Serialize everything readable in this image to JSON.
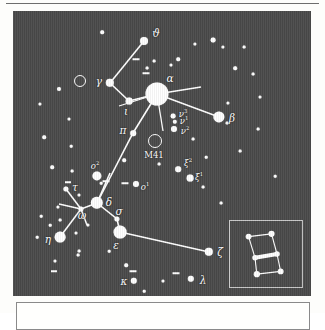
{
  "figure": {
    "kind": "star-chart",
    "constellation": "Canis Major",
    "sky_color": "#4a4a4a",
    "star_color": "#ffffff",
    "page_color": "#fdfdfb"
  },
  "chart_data": {
    "type": "scatter",
    "title": "",
    "xlabel": "",
    "ylabel": "",
    "grid": false,
    "legend": null,
    "xlim": [
      0,
      298
    ],
    "ylim": [
      0,
      285
    ],
    "note": "Canis Major star chart; x/y are panel pixel coordinates, r is plotted star radius (brighter star = larger radius).",
    "labeled_stars": [
      {
        "label": "ϑ",
        "name": "theta",
        "x": 131,
        "y": 30,
        "r": 4.0,
        "lx": 143,
        "ly": 22
      },
      {
        "label": "γ",
        "name": "gamma",
        "x": 97,
        "y": 72,
        "r": 4.2,
        "lx": 86,
        "ly": 70
      },
      {
        "label": "ι",
        "name": "iota",
        "x": 116,
        "y": 90,
        "r": 3.4,
        "lx": 113,
        "ly": 100
      },
      {
        "label": "α",
        "name": "alpha",
        "x": 144,
        "y": 83,
        "r": 11.5,
        "lx": 157,
        "ly": 67
      },
      {
        "label": "β",
        "name": "beta",
        "x": 206,
        "y": 106,
        "r": 5.6,
        "lx": 219,
        "ly": 107
      },
      {
        "label": "π",
        "name": "pi",
        "x": 120,
        "y": 122,
        "r": 2.8,
        "lx": 110,
        "ly": 119
      },
      {
        "label": "δ",
        "name": "delta",
        "x": 84,
        "y": 192,
        "r": 6.2,
        "lx": 96,
        "ly": 191
      },
      {
        "label": "ε",
        "name": "epsilon",
        "x": 107,
        "y": 221,
        "r": 6.4,
        "lx": 103,
        "ly": 234
      },
      {
        "label": "σ",
        "name": "sigma",
        "x": 104,
        "y": 208,
        "r": 2.6,
        "lx": 106,
        "ly": 200
      },
      {
        "label": "η",
        "name": "eta",
        "x": 47,
        "y": 226,
        "r": 5.4,
        "lx": 35,
        "ly": 228
      },
      {
        "label": "ζ",
        "name": "zeta",
        "x": 196,
        "y": 241,
        "r": 4.2,
        "lx": 207,
        "ly": 241
      },
      {
        "label": "κ",
        "name": "kappa",
        "x": 121,
        "y": 270,
        "r": 3.2,
        "lx": 111,
        "ly": 270
      },
      {
        "label": "λ",
        "name": "lambda",
        "x": 178,
        "y": 268,
        "r": 3.2,
        "lx": 190,
        "ly": 269
      },
      {
        "label": "τ",
        "name": "tau",
        "x": 53,
        "y": 178,
        "r": 2.6,
        "lx": 62,
        "ly": 176
      },
      {
        "label": "ω",
        "name": "omega",
        "x": 68,
        "y": 198,
        "r": 2.6,
        "lx": 69,
        "ly": 204
      }
    ],
    "superscript_stars": [
      {
        "label": "ν",
        "sup": "3",
        "name": "nu3",
        "x": 160,
        "y": 105,
        "r": 2.4,
        "lx": 170,
        "ly": 103
      },
      {
        "label": "ν",
        "sup": "1",
        "name": "nu1",
        "x": 162,
        "y": 111,
        "r": 2.2,
        "lx": 171,
        "ly": 110
      },
      {
        "label": "ν",
        "sup": "2",
        "name": "nu2",
        "x": 161,
        "y": 118,
        "r": 3.0,
        "lx": 172,
        "ly": 120
      },
      {
        "label": "ξ",
        "sup": "2",
        "name": "xi2",
        "x": 165,
        "y": 158,
        "r": 2.8,
        "lx": 175,
        "ly": 152
      },
      {
        "label": "ξ",
        "sup": "1",
        "name": "xi1",
        "x": 177,
        "y": 167,
        "r": 3.4,
        "lx": 186,
        "ly": 166
      },
      {
        "label": "ο",
        "sup": "2",
        "name": "omicron2",
        "x": 84,
        "y": 165,
        "r": 4.6,
        "lx": 82,
        "ly": 155
      },
      {
        "label": "ο",
        "sup": "1",
        "name": "omicron1",
        "x": 123,
        "y": 173,
        "r": 3.0,
        "lx": 132,
        "ly": 176
      }
    ],
    "deep_sky_objects": [
      {
        "label": "M41",
        "name": "m41-cluster",
        "x": 142,
        "y": 130,
        "r": 6.0,
        "lx": 141,
        "ly": 144
      },
      {
        "label": "",
        "name": "cluster-ring-upper-left",
        "x": 67,
        "y": 70,
        "r": 5.0,
        "lx": 0,
        "ly": 0
      }
    ],
    "constellation_lines": [
      {
        "from": "theta",
        "points": "131,30 97,72"
      },
      {
        "from": "gamma",
        "points": "97,72 116,90"
      },
      {
        "from": "iota",
        "points": "116,90 144,83"
      },
      {
        "from": "alpha-beta",
        "points": "144,83 206,106"
      },
      {
        "from": "alpha-pi-delta",
        "points": "144,83 120,122 84,192"
      },
      {
        "from": "omicron2-delta",
        "points": "97,162 84,192"
      },
      {
        "from": "delta-sigma-epsilon",
        "points": "84,192 104,208 107,221"
      },
      {
        "from": "epsilon-zeta",
        "points": "107,221 196,241"
      },
      {
        "from": "delta-omega",
        "points": "84,192 68,198"
      },
      {
        "from": "omega-tau",
        "points": "68,198 53,178"
      },
      {
        "from": "omega-eta",
        "points": "68,198 47,226"
      },
      {
        "from": "omega-left",
        "points": "68,198 46,193"
      },
      {
        "from": "omega-down",
        "points": "68,198 74,214"
      }
    ],
    "field_stars": [
      {
        "x": 89,
        "y": 21,
        "r": 1.8
      },
      {
        "x": 182,
        "y": 33,
        "r": 1.6
      },
      {
        "x": 200,
        "y": 29,
        "r": 2.4
      },
      {
        "x": 210,
        "y": 36,
        "r": 1.6
      },
      {
        "x": 158,
        "y": 54,
        "r": 1.5
      },
      {
        "x": 141,
        "y": 50,
        "r": 1.4
      },
      {
        "x": 134,
        "y": 57,
        "r": 1.4
      },
      {
        "x": 165,
        "y": 48,
        "r": 1.8
      },
      {
        "x": 222,
        "y": 57,
        "r": 1.8
      },
      {
        "x": 231,
        "y": 36,
        "r": 1.4
      },
      {
        "x": 46,
        "y": 78,
        "r": 2.0
      },
      {
        "x": 27,
        "y": 93,
        "r": 1.6
      },
      {
        "x": 215,
        "y": 92,
        "r": 1.6
      },
      {
        "x": 247,
        "y": 86,
        "r": 1.5
      },
      {
        "x": 56,
        "y": 108,
        "r": 1.5
      },
      {
        "x": 214,
        "y": 112,
        "r": 1.4
      },
      {
        "x": 31,
        "y": 126,
        "r": 1.8
      },
      {
        "x": 180,
        "y": 128,
        "r": 1.4
      },
      {
        "x": 227,
        "y": 140,
        "r": 1.4
      },
      {
        "x": 111,
        "y": 149,
        "r": 1.8
      },
      {
        "x": 39,
        "y": 156,
        "r": 1.8
      },
      {
        "x": 59,
        "y": 160,
        "r": 1.4
      },
      {
        "x": 146,
        "y": 153,
        "r": 1.4
      },
      {
        "x": 193,
        "y": 146,
        "r": 1.3
      },
      {
        "x": 66,
        "y": 184,
        "r": 1.5
      },
      {
        "x": 45,
        "y": 196,
        "r": 1.6
      },
      {
        "x": 75,
        "y": 214,
        "r": 1.6
      },
      {
        "x": 47,
        "y": 209,
        "r": 1.4
      },
      {
        "x": 28,
        "y": 205,
        "r": 1.3
      },
      {
        "x": 63,
        "y": 222,
        "r": 1.5
      },
      {
        "x": 37,
        "y": 214,
        "r": 1.3
      },
      {
        "x": 24,
        "y": 226,
        "r": 1.3
      },
      {
        "x": 66,
        "y": 240,
        "r": 1.4
      },
      {
        "x": 42,
        "y": 250,
        "r": 1.5
      },
      {
        "x": 113,
        "y": 254,
        "r": 1.8
      },
      {
        "x": 65,
        "y": 244,
        "r": 1.4
      },
      {
        "x": 131,
        "y": 280,
        "r": 1.3
      },
      {
        "x": 150,
        "y": 270,
        "r": 1.5
      },
      {
        "x": 190,
        "y": 176,
        "r": 1.4
      },
      {
        "x": 208,
        "y": 192,
        "r": 1.4
      },
      {
        "x": 245,
        "y": 118,
        "r": 1.4
      },
      {
        "x": 240,
        "y": 63,
        "r": 1.4
      },
      {
        "x": 96,
        "y": 240,
        "r": 1.3
      },
      {
        "x": 88,
        "y": 172,
        "r": 1.3
      },
      {
        "x": 58,
        "y": 135,
        "r": 1.3
      },
      {
        "x": 262,
        "y": 165,
        "r": 1.3
      }
    ],
    "dash_markers": [
      {
        "x": 123,
        "y": 48,
        "w": 7
      },
      {
        "x": 133,
        "y": 62,
        "w": 7
      },
      {
        "x": 112,
        "y": 172,
        "w": 7
      },
      {
        "x": 93,
        "y": 170,
        "w": 7
      },
      {
        "x": 120,
        "y": 260,
        "w": 7
      },
      {
        "x": 163,
        "y": 262,
        "w": 7
      },
      {
        "x": 55,
        "y": 171,
        "w": 6
      },
      {
        "x": 41,
        "y": 260,
        "w": 6
      }
    ]
  },
  "inset": {
    "name": "orion-inset",
    "label": "Orion",
    "stars": [
      {
        "x": 17,
        "y": 17,
        "r": 3.2
      },
      {
        "x": 42,
        "y": 14,
        "r": 3.4
      },
      {
        "x": 48,
        "y": 36,
        "r": 3.0
      },
      {
        "x": 24,
        "y": 40,
        "r": 3.0
      },
      {
        "x": 52,
        "y": 55,
        "r": 3.2
      },
      {
        "x": 26,
        "y": 58,
        "r": 3.4
      }
    ],
    "belt": {
      "x1": 24,
      "y1": 40,
      "x2": 48,
      "y2": 36
    },
    "lines": [
      "17,17 42,14",
      "42,14 48,36",
      "17,17 24,40",
      "24,40 26,58",
      "48,36 52,55",
      "26,58 52,55"
    ]
  }
}
